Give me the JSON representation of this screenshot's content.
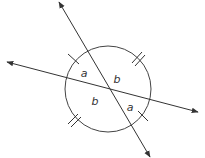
{
  "diagram": {
    "type": "circle with two intersecting lines through center",
    "circle": {
      "cx": 108,
      "cy": 89,
      "r": 43
    },
    "lines": [
      {
        "name": "steep-line",
        "x1": 59,
        "y1": 2,
        "x2": 150,
        "y2": 157,
        "arrows": "both"
      },
      {
        "name": "shallow-line",
        "x1": 7,
        "y1": 62,
        "x2": 198,
        "y2": 112,
        "arrows": "both"
      }
    ],
    "angle_labels": [
      {
        "text": "a",
        "x": 84,
        "y": 73
      },
      {
        "text": "b",
        "x": 117,
        "y": 79
      },
      {
        "text": "b",
        "x": 95,
        "y": 101
      },
      {
        "text": "a",
        "x": 130,
        "y": 107
      }
    ],
    "tick_marks": {
      "single": [
        "upper-left arc",
        "lower-right arc"
      ],
      "double": [
        "upper-right arc",
        "lower-left arc"
      ]
    },
    "stroke_color": "#333333"
  }
}
